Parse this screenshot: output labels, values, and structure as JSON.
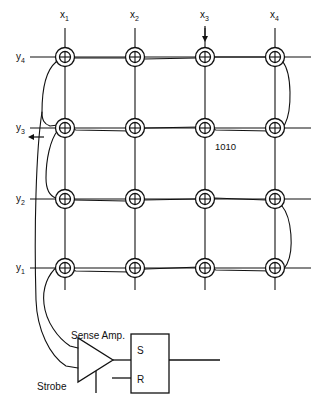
{
  "diagram": {
    "type": "schematic",
    "stroke_color": "#111111",
    "background_color": "#ffffff"
  },
  "x_lines": [
    {
      "id": "x1",
      "label": "x",
      "subscript": "1",
      "cx": 65,
      "label_x": 60,
      "label_y": 18,
      "arrow": false
    },
    {
      "id": "x2",
      "label": "x",
      "subscript": "2",
      "cx": 135,
      "label_x": 130,
      "label_y": 18,
      "arrow": false
    },
    {
      "id": "x3",
      "label": "x",
      "subscript": "3",
      "cx": 205,
      "label_x": 200,
      "label_y": 18,
      "arrow": true
    },
    {
      "id": "x4",
      "label": "x",
      "subscript": "4",
      "cx": 275,
      "label_x": 270,
      "label_y": 18,
      "arrow": false
    }
  ],
  "y_lines": [
    {
      "id": "y4",
      "label": "y",
      "subscript": "4",
      "cy": 57,
      "label_x": 16,
      "label_y": 60,
      "arrow": false
    },
    {
      "id": "y3",
      "label": "y",
      "subscript": "3",
      "cy": 128,
      "label_x": 16,
      "label_y": 131,
      "arrow": true
    },
    {
      "id": "y2",
      "label": "y",
      "subscript": "2",
      "cy": 199,
      "label_x": 16,
      "label_y": 202,
      "arrow": false
    },
    {
      "id": "y1",
      "label": "y",
      "subscript": "1",
      "cy": 268,
      "label_x": 16,
      "label_y": 271,
      "arrow": false
    }
  ],
  "annotations": [
    {
      "name": "selected-core-value",
      "text": "1010",
      "x": 215,
      "y": 150
    }
  ],
  "sense_amp": {
    "label": "Sense Amp.",
    "label_x": 71,
    "label_y": 339,
    "strobe_label": "Strobe",
    "strobe_label_x": 37,
    "strobe_label_y": 390
  },
  "flip_flop": {
    "set_label": "S",
    "reset_label": "R",
    "set_label_x": 137,
    "set_label_y": 354,
    "reset_label_x": 137,
    "reset_label_y": 383
  },
  "core_geometry": {
    "outer_radius": 9.5,
    "inner_radius": 5.5,
    "count": 16
  }
}
